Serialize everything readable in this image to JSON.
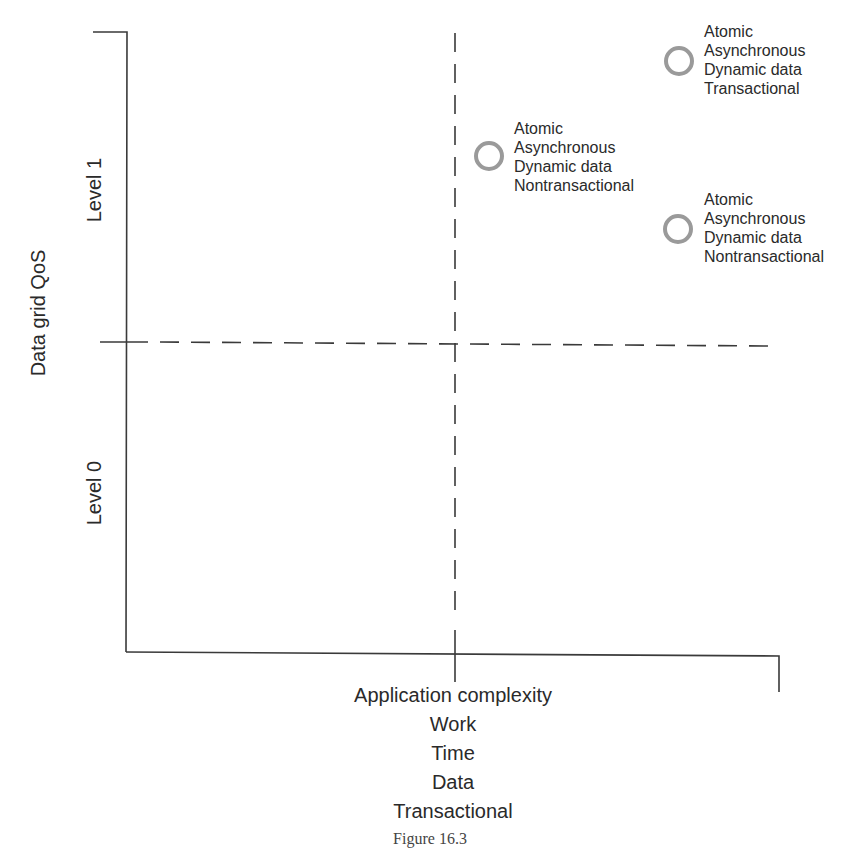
{
  "diagram": {
    "type": "quadrant",
    "y_axis": {
      "title": "Data grid QoS",
      "levels": [
        "Level 0",
        "Level 1"
      ]
    },
    "x_axis": {
      "title_lines": [
        "Application complexity",
        "Work",
        "Time",
        "Data",
        "Transactional"
      ]
    },
    "points": [
      {
        "id": "p1",
        "quadrant": "upper-right",
        "lines": [
          "Atomic",
          "Asynchronous",
          "Dynamic data",
          "Nontransactional"
        ]
      },
      {
        "id": "p2",
        "quadrant": "upper-right",
        "lines": [
          "Atomic",
          "Asynchronous",
          "Dynamic data",
          "Transactional"
        ]
      },
      {
        "id": "p3",
        "quadrant": "upper-right",
        "lines": [
          "Atomic",
          "Asynchronous",
          "Dynamic data",
          "Nontransactional"
        ]
      }
    ],
    "colors": {
      "axis": "#3a3a3a",
      "marker": "#9a9a9a",
      "text": "#2a2a2a"
    }
  },
  "caption": "Figure 16.3"
}
